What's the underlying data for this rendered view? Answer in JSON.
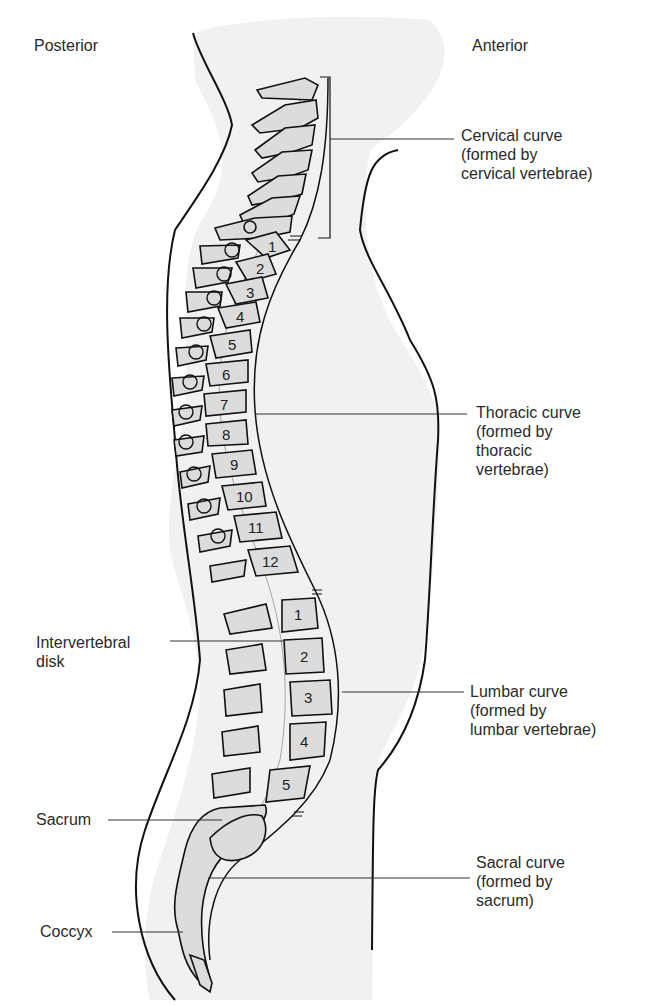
{
  "figure": {
    "orientation": {
      "left": "Posterior",
      "right": "Anterior"
    },
    "right_labels": [
      {
        "id": "cervical",
        "lines": [
          "Cervical curve",
          "(formed by",
          "cervical vertebrae)"
        ]
      },
      {
        "id": "thoracic",
        "lines": [
          "Thoracic curve",
          "(formed by",
          "thoracic",
          "vertebrae)"
        ]
      },
      {
        "id": "lumbar",
        "lines": [
          "Lumbar curve",
          "(formed by",
          "lumbar vertebrae)"
        ]
      },
      {
        "id": "sacral",
        "lines": [
          "Sacral curve",
          "(formed by",
          "sacrum)"
        ]
      }
    ],
    "left_labels": [
      {
        "id": "disk",
        "lines": [
          "Intervertebral",
          "disk"
        ]
      },
      {
        "id": "sacrum",
        "lines": [
          "Sacrum"
        ]
      },
      {
        "id": "coccyx",
        "lines": [
          "Coccyx"
        ]
      }
    ],
    "thoracic_numbers": [
      "1",
      "2",
      "3",
      "4",
      "5",
      "6",
      "7",
      "8",
      "9",
      "10",
      "11",
      "12"
    ],
    "lumbar_numbers": [
      "1",
      "2",
      "3",
      "4",
      "5"
    ],
    "colors": {
      "body_fill": "#f1f1f1",
      "bone_fill": "#dcdcdc",
      "outline": "#111111",
      "leader": "#333333"
    }
  }
}
